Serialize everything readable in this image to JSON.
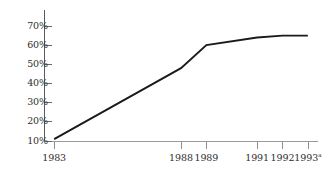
{
  "chart_data": {
    "type": "line",
    "title": "",
    "xlabel": "",
    "ylabel": "",
    "x": [
      1983,
      1988,
      1989,
      1991,
      1992,
      1993
    ],
    "categories": [
      "1983",
      "1988",
      "1989",
      "1991",
      "1992",
      "1993"
    ],
    "values": [
      11,
      48,
      60,
      64,
      65,
      65
    ],
    "series": [
      {
        "name": "",
        "values": [
          11,
          48,
          60,
          64,
          65,
          65
        ]
      }
    ],
    "ylim": [
      0,
      75
    ],
    "xlim": [
      1982.6,
      1993.4
    ],
    "yticks": [
      10,
      20,
      30,
      40,
      50,
      60,
      70
    ],
    "ytick_labels": [
      "10%",
      "20%",
      "30%",
      "40%",
      "50%",
      "60%",
      "70%"
    ],
    "xtick_labels": [
      "1983",
      "1988",
      "1989",
      "1991",
      "1992",
      "1993"
    ],
    "grid": false,
    "legend": null,
    "line_color": "#1a1a1a",
    "axis_color": "#8d8d8d",
    "footnote_marker": "a",
    "footnote_on": "1993"
  },
  "axis": {
    "y_labels": [
      {
        "text": "70%",
        "value": 70
      },
      {
        "text": "60%",
        "value": 60
      },
      {
        "text": "50%",
        "value": 50
      },
      {
        "text": "40%",
        "value": 40
      },
      {
        "text": "30%",
        "value": 30
      },
      {
        "text": "20%",
        "value": 20
      },
      {
        "text": "10%",
        "value": 10
      }
    ],
    "x_labels": [
      {
        "text": "1983",
        "sup": ""
      },
      {
        "text": "1988",
        "sup": ""
      },
      {
        "text": "1989",
        "sup": ""
      },
      {
        "text": "1991",
        "sup": ""
      },
      {
        "text": "1992",
        "sup": ""
      },
      {
        "text": "1993",
        "sup": "a"
      }
    ]
  }
}
